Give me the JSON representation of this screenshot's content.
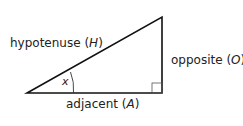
{
  "diagram": {
    "type": "right-triangle",
    "labels": {
      "hypotenuse": {
        "word": "hypotenuse",
        "symbol": "H"
      },
      "opposite": {
        "word": "opposite",
        "symbol": "O"
      },
      "adjacent": {
        "word": "adjacent",
        "symbol": "A"
      },
      "angle": "x"
    },
    "line_color": "#111111"
  }
}
